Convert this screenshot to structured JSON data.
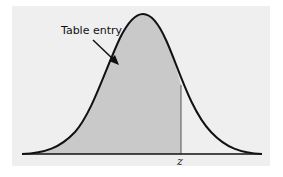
{
  "figure": {
    "annotation": "Table entry",
    "axis_label": "z",
    "colors": {
      "panel": "#efefef",
      "shade": "#c9c9c9",
      "curve": "#111111"
    }
  }
}
